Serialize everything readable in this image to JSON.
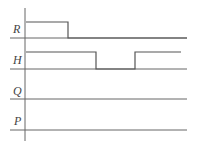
{
  "diagram": {
    "type": "timing-diagram",
    "signals": [
      {
        "label": "R",
        "baseline_y": 38,
        "high_y": 22,
        "waveform": [
          {
            "from": 26,
            "to": 68,
            "level": "high"
          },
          {
            "from": 68,
            "to": 187,
            "level": "low"
          }
        ]
      },
      {
        "label": "H",
        "baseline_y": 69,
        "high_y": 52,
        "waveform": [
          {
            "from": 26,
            "to": 96,
            "level": "high"
          },
          {
            "from": 96,
            "to": 135,
            "level": "low"
          },
          {
            "from": 135,
            "to": 181,
            "level": "high"
          }
        ]
      },
      {
        "label": "Q",
        "baseline_y": 99,
        "waveform": []
      },
      {
        "label": "P",
        "baseline_y": 130,
        "waveform": []
      }
    ]
  }
}
